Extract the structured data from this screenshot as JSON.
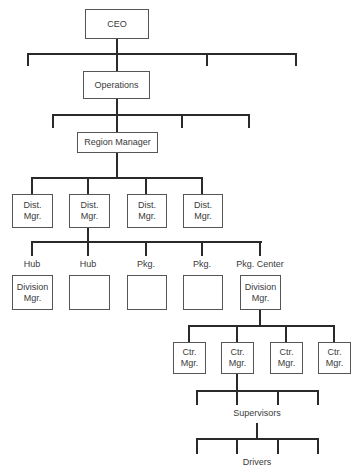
{
  "chart": {
    "nodes": {
      "ceo": "CEO",
      "operations": "Operations",
      "region_manager": "Region Manager",
      "dist_mgrs": [
        "Dist.\nMgr.",
        "Dist.\nMgr.",
        "Dist.\nMgr.",
        "Dist.\nMgr."
      ],
      "facility_labels": [
        "Hub",
        "Hub",
        "Pkg.",
        "Pkg.",
        "Pkg. Center"
      ],
      "facility_boxes": [
        "Division\nMgr.",
        "",
        "",
        "",
        "Division\nMgr."
      ],
      "ctr_mgrs": [
        "Ctr.\nMgr.",
        "Ctr.\nMgr.",
        "Ctr.\nMgr.",
        "Ctr.\nMgr."
      ],
      "supervisors": "Supervisors",
      "drivers": "Drivers"
    }
  }
}
